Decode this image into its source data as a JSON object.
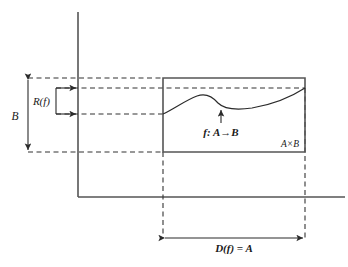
{
  "figure": {
    "type": "math-diagram",
    "background_color": "#ffffff",
    "line_color": "#555555",
    "dash_color": "#333333",
    "curve_color": "#2b2b2b"
  },
  "labels": {
    "codomain": "B",
    "range": "R(f)",
    "function": "f: A→B",
    "product": "A×B",
    "domain": "D(f) = A"
  },
  "axes": {
    "vertical": {
      "x": 78,
      "y_top": 12,
      "y_bottom": 197
    },
    "horizontal": {
      "y": 197,
      "x_left": 78,
      "x_right": 345
    }
  },
  "product_box": {
    "left": 163,
    "right": 305,
    "top": 78,
    "bottom": 152
  },
  "range_band": {
    "upper_y": 88,
    "lower_y": 114,
    "bracket_x": 56
  },
  "measure_b": {
    "x": 28,
    "y_top": 78,
    "y_bottom": 152
  },
  "measure_d": {
    "y": 238,
    "x_left": 163,
    "x_right": 305
  },
  "curve_points": [
    {
      "x": 163,
      "y": 114
    },
    {
      "x": 180,
      "y": 106
    },
    {
      "x": 196,
      "y": 97
    },
    {
      "x": 207,
      "y": 95
    },
    {
      "x": 216,
      "y": 100
    },
    {
      "x": 226,
      "y": 106
    },
    {
      "x": 240,
      "y": 108
    },
    {
      "x": 260,
      "y": 107
    },
    {
      "x": 280,
      "y": 100
    },
    {
      "x": 305,
      "y": 88
    }
  ],
  "pointer_arrow": {
    "x": 221,
    "y_tail": 123,
    "y_head": 108
  }
}
